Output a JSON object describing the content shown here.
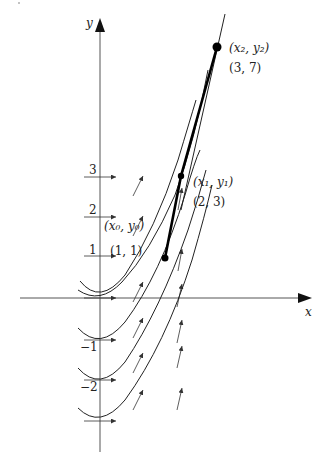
{
  "diagram": {
    "title": "",
    "type": "euler-method-direction-field",
    "axes": {
      "x_label": "x",
      "y_label": "y",
      "y_ticks": [
        {
          "value": 3,
          "label": "3"
        },
        {
          "value": 2,
          "label": "2"
        },
        {
          "value": 1,
          "label": "1"
        },
        {
          "value": -1,
          "label": "−1"
        },
        {
          "value": -2,
          "label": "−2"
        }
      ]
    },
    "points": [
      {
        "symbol_x": "x",
        "symbol_y": "y",
        "index": "0",
        "coords_label": "(1, 1)"
      },
      {
        "symbol_x": "x",
        "symbol_y": "y",
        "index": "1",
        "coords_label": "(2, 3)"
      },
      {
        "symbol_x": "x",
        "symbol_y": "y",
        "index": "2",
        "coords_label": "(3, 7)"
      }
    ],
    "point_labels": {
      "p0": "(x₀, y₀)",
      "p1": "(x₁, y₁)",
      "p2": "(x₂, y₂)"
    },
    "solution_curves": [
      "through (1,1)",
      "vertex at y=0",
      "vertex at y=-1",
      "vertex at y=-2"
    ],
    "colors": {
      "stroke": "#222222",
      "axis": "#555555",
      "background": "#ffffff"
    }
  }
}
